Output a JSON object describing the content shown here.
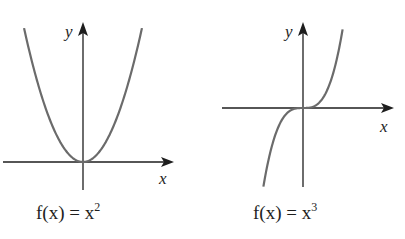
{
  "chart_data": [
    {
      "type": "line",
      "function": "x^2",
      "caption": {
        "prefix": "f(x) = x",
        "exponent": "2"
      },
      "xlabel": "x",
      "ylabel": "y",
      "xlim": [
        -1.5,
        1.5
      ],
      "ylim": [
        -0.4,
        2.3
      ],
      "x_sample_range": [
        -1.5,
        1.5
      ],
      "grid": false,
      "curve_color": "#6b6b6b",
      "axis_color": "#1e1e1e"
    },
    {
      "type": "line",
      "function": "x^3",
      "caption": {
        "prefix": "f(x) = x",
        "exponent": "3"
      },
      "xlabel": "x",
      "ylabel": "y",
      "xlim": [
        -1.7,
        1.7
      ],
      "ylim": [
        -1.7,
        1.7
      ],
      "x_sample_range": [
        -1.2,
        1.2
      ],
      "grid": false,
      "curve_color": "#6b6b6b",
      "axis_color": "#1e1e1e"
    }
  ]
}
